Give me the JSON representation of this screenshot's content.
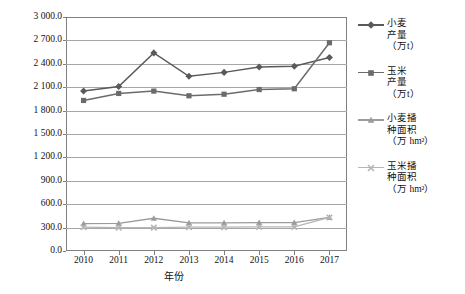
{
  "chart_data": {
    "type": "line",
    "title": "",
    "xlabel": "年份",
    "ylabel": "",
    "categories": [
      "2010",
      "2011",
      "2012",
      "2013",
      "2014",
      "2015",
      "2016",
      "2017"
    ],
    "x": [
      2010,
      2011,
      2012,
      2013,
      2014,
      2015,
      2016,
      2017
    ],
    "ylim": [
      0,
      3000
    ],
    "ytick_values": [
      0,
      300,
      600,
      900,
      1200,
      1500,
      1800,
      2100,
      2400,
      2700,
      3000
    ],
    "ytick_labels": [
      "0.0",
      "300.0",
      "600.0",
      "900.0",
      "1 200.0",
      "1 500.0",
      "1 800.0",
      "2 100.0",
      "2 400.0",
      "2 700.0",
      "3 000.0"
    ],
    "grid": true,
    "legend_position": "right",
    "series": [
      {
        "name": "小麦产量（万t）",
        "label_lines": [
          "小麦",
          "产量",
          "（万t）"
        ],
        "marker": "diamond",
        "color": "#5a5a5a",
        "values": [
          2050,
          2110,
          2540,
          2240,
          2290,
          2360,
          2370,
          2480
        ]
      },
      {
        "name": "玉米产量（万t）",
        "label_lines": [
          "玉米",
          "产量",
          "（万t）"
        ],
        "marker": "square",
        "color": "#6b6b6b",
        "values": [
          1930,
          2020,
          2050,
          1990,
          2010,
          2070,
          2080,
          2670
        ]
      },
      {
        "name": "小麦播种面积（万hm²）",
        "label_lines": [
          "小麦播",
          "种面积",
          "（万 hm²）"
        ],
        "marker": "triangle",
        "color": "#9b9b9b",
        "values": [
          350,
          355,
          420,
          360,
          360,
          365,
          365,
          430
        ]
      },
      {
        "name": "玉米播种面积（万hm²）",
        "label_lines": [
          "玉米播",
          "种面积",
          "（万 hm²）"
        ],
        "marker": "cross",
        "color": "#b5b5b5",
        "values": [
          305,
          300,
          300,
          305,
          305,
          310,
          310,
          430
        ]
      }
    ]
  }
}
